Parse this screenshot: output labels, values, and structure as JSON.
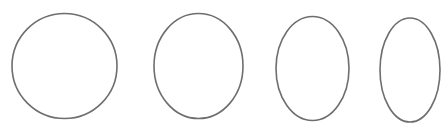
{
  "canvas": {
    "width": 445,
    "height": 134,
    "background": "#ffffff"
  },
  "stroke": {
    "color": "#6e6e6e",
    "width": 1.6
  },
  "shapes": [
    {
      "type": "ellipse",
      "cx": 64.5,
      "cy": 66,
      "rx": 52.5,
      "ry": 52.5
    },
    {
      "type": "ellipse",
      "cx": 198.5,
      "cy": 66,
      "rx": 44.5,
      "ry": 52.5
    },
    {
      "type": "ellipse",
      "cx": 312.5,
      "cy": 68.5,
      "rx": 36.5,
      "ry": 52
    },
    {
      "type": "ellipse",
      "cx": 410,
      "cy": 70,
      "rx": 30,
      "ry": 52
    }
  ]
}
